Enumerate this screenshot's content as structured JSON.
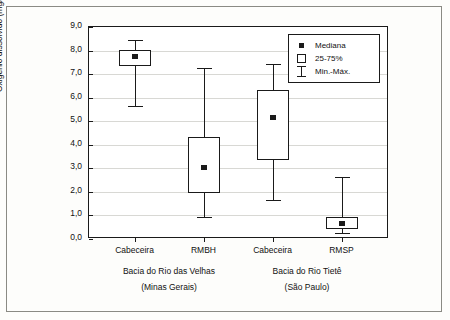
{
  "chart_data": {
    "type": "box",
    "title": "",
    "xlabel": "",
    "ylabel": "Oxigênio dissolvido (mg/L)",
    "ylim": [
      0.0,
      9.0
    ],
    "ytick_labels": [
      "0,0",
      "1,0",
      "2,0",
      "3,0",
      "4,0",
      "5,0",
      "6,0",
      "7,0",
      "8,0",
      "9,0"
    ],
    "ytick_values": [
      0.0,
      1.0,
      2.0,
      3.0,
      4.0,
      5.0,
      6.0,
      7.0,
      8.0,
      9.0
    ],
    "grid": true,
    "categories": [
      "Cabeceira",
      "RMBH",
      "Cabeceira",
      "RMSP"
    ],
    "groups": [
      {
        "label": "Bacia do Rio das Velhas",
        "sublabel": "(Minas Gerais)",
        "categories": [
          "Cabeceira",
          "RMBH"
        ]
      },
      {
        "label": "Bacia do Rio Tietê",
        "sublabel": "(São Paulo)",
        "categories": [
          "Cabeceira",
          "RMSP"
        ]
      }
    ],
    "boxes": [
      {
        "category": "Cabeceira",
        "group": "Bacia do Rio das Velhas",
        "min": 5.6,
        "q1": 7.3,
        "median": 7.7,
        "q3": 8.0,
        "max": 8.4
      },
      {
        "category": "RMBH",
        "group": "Bacia do Rio das Velhas",
        "min": 0.9,
        "q1": 1.9,
        "median": 3.0,
        "q3": 4.3,
        "max": 7.2
      },
      {
        "category": "Cabeceira",
        "group": "Bacia do Rio Tietê",
        "min": 1.6,
        "q1": 3.3,
        "median": 5.1,
        "q3": 6.3,
        "max": 7.4
      },
      {
        "category": "RMSP",
        "group": "Bacia do Rio Tietê",
        "min": 0.2,
        "q1": 0.4,
        "median": 0.6,
        "q3": 0.9,
        "max": 2.6
      }
    ],
    "legend": {
      "position": "top-right-inside",
      "entries": [
        {
          "key": "median-marker",
          "label": "Mediana"
        },
        {
          "key": "box-marker",
          "label": "25-75%"
        },
        {
          "key": "whisker-marker",
          "label": "Min.-Máx."
        }
      ]
    }
  }
}
